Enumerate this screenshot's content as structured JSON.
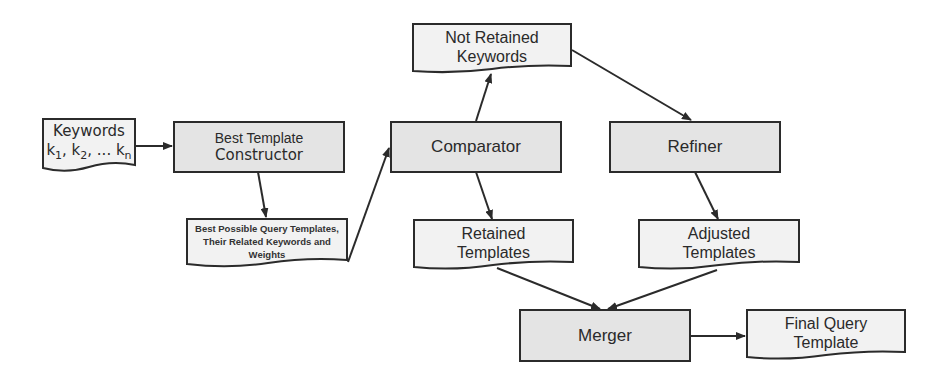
{
  "diagram": {
    "type": "flowchart",
    "nodes": {
      "keywords": {
        "shape": "document",
        "line1": "Keywords",
        "line2_parts": [
          "k",
          "1",
          ", k",
          "2",
          ", ... k",
          "n"
        ]
      },
      "best_template_constructor": {
        "shape": "process",
        "line1": "Best Template",
        "line2": "Constructor"
      },
      "best_possible": {
        "shape": "document",
        "line1": "Best Possible Query Templates,",
        "line2": "Their Related Keywords and",
        "line3": "Weights"
      },
      "comparator": {
        "shape": "process",
        "label": "Comparator"
      },
      "not_retained": {
        "shape": "document",
        "line1": "Not Retained",
        "line2": "Keywords"
      },
      "refiner": {
        "shape": "process",
        "label": "Refiner"
      },
      "retained": {
        "shape": "document",
        "line1": "Retained",
        "line2": "Templates"
      },
      "adjusted": {
        "shape": "document",
        "line1": "Adjusted",
        "line2": "Templates"
      },
      "merger": {
        "shape": "process",
        "label": "Merger"
      },
      "final": {
        "shape": "document",
        "line1": "Final Query",
        "line2": "Template"
      }
    },
    "edges": [
      {
        "from": "Keywords",
        "to": "Best Template Constructor"
      },
      {
        "from": "Best Template Constructor",
        "to": "Best Possible Query Templates"
      },
      {
        "from": "Best Possible Query Templates",
        "to": "Comparator"
      },
      {
        "from": "Comparator",
        "to": "Not Retained Keywords"
      },
      {
        "from": "Comparator",
        "to": "Retained Templates"
      },
      {
        "from": "Not Retained Keywords",
        "to": "Refiner"
      },
      {
        "from": "Refiner",
        "to": "Adjusted Templates"
      },
      {
        "from": "Retained Templates",
        "to": "Merger"
      },
      {
        "from": "Adjusted Templates",
        "to": "Merger"
      },
      {
        "from": "Merger",
        "to": "Final Query Template"
      }
    ],
    "colors": {
      "process_fill": "#e4e4e4",
      "document_fill": "#f2f2f2",
      "stroke": "#2b2b2b",
      "text": "#2a2a2a"
    }
  }
}
